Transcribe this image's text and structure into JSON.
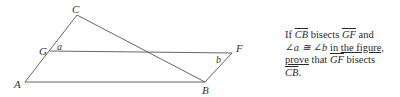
{
  "figure": {
    "points": {
      "A": {
        "label": "A",
        "x": 25,
        "y": 82
      },
      "B": {
        "label": "B",
        "x": 205,
        "y": 82
      },
      "C": {
        "label": "C",
        "x": 77,
        "y": 15
      },
      "G": {
        "label": "G",
        "x": 50,
        "y": 51
      },
      "F": {
        "label": "F",
        "x": 232,
        "y": 53
      }
    },
    "angles": {
      "a": "a",
      "b": "b"
    },
    "stroke_color": "#555555"
  },
  "problem": {
    "t1": "If ",
    "seg_cb": "CB",
    "t2": " bisects ",
    "seg_gf": "GF",
    "t3": " and",
    "angle_a": "∠a ≅ ∠b",
    "t4": " in ",
    "t5": "the figure,",
    "t6": "prove",
    "t7": " that ",
    "seg_gf2": "GF",
    "t8": " bisects",
    "seg_cb2": "CB",
    "t9": "."
  }
}
